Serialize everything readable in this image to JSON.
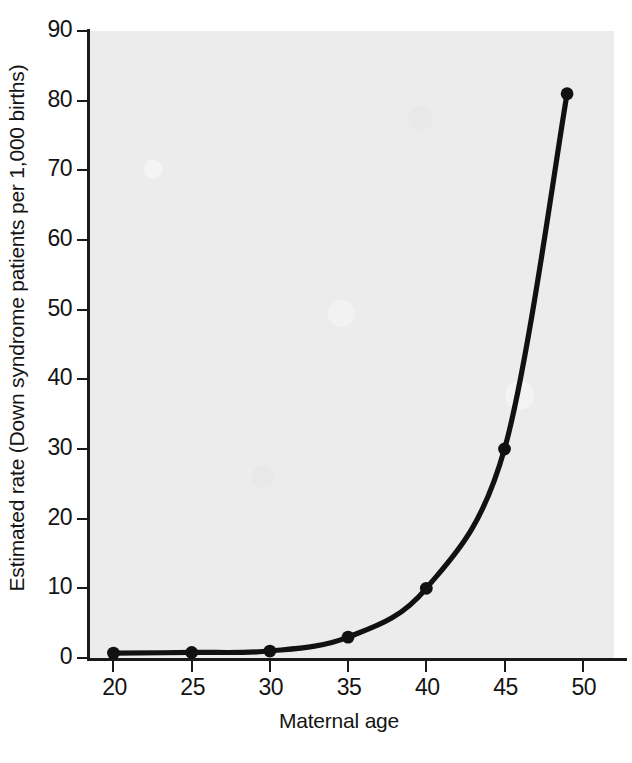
{
  "chart_data": {
    "type": "line",
    "title": "",
    "subtitle": "",
    "xlabel": "Maternal age",
    "ylabel": "Estimated rate (Down syndrome patients per 1,000 births)",
    "x": [
      20,
      25,
      30,
      35,
      40,
      45,
      49
    ],
    "values": [
      0.7,
      0.8,
      1.0,
      3.0,
      10.0,
      30.0,
      81.0
    ],
    "series": [
      {
        "name": "Estimated rate",
        "x": [
          20,
          25,
          30,
          35,
          40,
          45,
          49
        ],
        "values": [
          0.7,
          0.8,
          1.0,
          3.0,
          10.0,
          30.0,
          81.0
        ]
      }
    ],
    "xlim": [
      18.5,
      52
    ],
    "ylim": [
      0,
      90
    ],
    "xticks": [
      20,
      25,
      30,
      35,
      40,
      45,
      50
    ],
    "yticks": [
      0,
      10,
      20,
      30,
      40,
      50,
      60,
      70,
      80,
      90
    ],
    "xtick_labels": [
      "20",
      "25",
      "30",
      "35",
      "40",
      "45",
      "50"
    ],
    "ytick_labels": [
      "0",
      "10",
      "20",
      "30",
      "40",
      "50",
      "60",
      "70",
      "80",
      "90"
    ],
    "grid": false,
    "legend": null,
    "legend_position": "none",
    "marker": "filled-circle",
    "line_color": "#111111",
    "marker_color": "#111111",
    "panel_color": "#ececed",
    "axis_color": "#1a1a1a",
    "text_color": "#141414",
    "annotations": []
  },
  "axes": {
    "x_title": "Maternal age",
    "y_title": "Estimated rate (Down syndrome patients per 1,000 births)"
  }
}
